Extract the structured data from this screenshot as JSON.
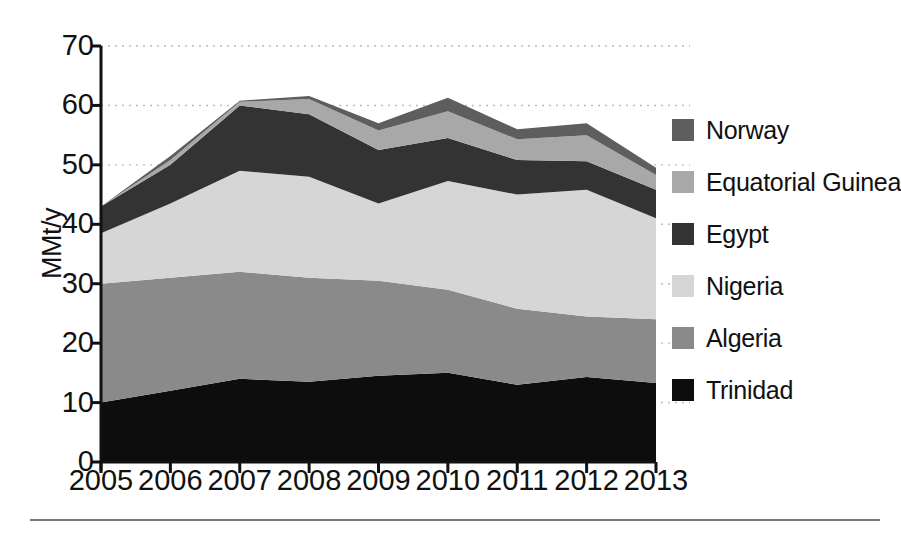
{
  "chart_data": {
    "type": "area",
    "stacked": true,
    "title": "",
    "xlabel": "",
    "ylabel": "MMt/y",
    "categories": [
      "2005",
      "2006",
      "2007",
      "2008",
      "2009",
      "2010",
      "2011",
      "2012",
      "2013"
    ],
    "x": [
      2005,
      2006,
      2007,
      2008,
      2009,
      2010,
      2011,
      2012,
      2013
    ],
    "ylim": [
      0,
      70
    ],
    "yticks": [
      0,
      10,
      20,
      30,
      40,
      50,
      60,
      70
    ],
    "ytick_labels": [
      "0",
      "10",
      "20",
      "30",
      "40",
      "50",
      "60",
      "70"
    ],
    "grid": "horizontal-dotted",
    "legend_position": "right",
    "series": [
      {
        "name": "Trinidad",
        "color": "#0d0d0d",
        "values": [
          10.0,
          12.0,
          14.0,
          13.5,
          14.5,
          15.0,
          13.0,
          14.3,
          13.3
        ]
      },
      {
        "name": "Algeria",
        "color": "#8a8a8a",
        "values": [
          20.0,
          19.0,
          18.0,
          17.5,
          16.0,
          14.0,
          12.8,
          10.2,
          10.7
        ]
      },
      {
        "name": "Nigeria",
        "color": "#d6d6d6",
        "values": [
          8.5,
          12.5,
          17.0,
          17.0,
          13.0,
          18.3,
          19.2,
          21.3,
          17.0
        ]
      },
      {
        "name": "Egypt",
        "color": "#333333",
        "values": [
          4.5,
          6.5,
          11.0,
          10.5,
          9.0,
          7.2,
          5.8,
          4.8,
          4.8
        ]
      },
      {
        "name": "Equatorial Guinea",
        "color": "#a8a8a8",
        "values": [
          0.0,
          0.8,
          0.6,
          2.6,
          3.3,
          4.5,
          3.5,
          4.4,
          2.5
        ]
      },
      {
        "name": "Norway",
        "color": "#5e5e5e",
        "values": [
          0.0,
          0.7,
          0.2,
          0.5,
          1.2,
          2.3,
          1.7,
          2.0,
          1.2
        ]
      }
    ],
    "stack_order_bottom_to_top": [
      "Trinidad",
      "Algeria",
      "Nigeria",
      "Egypt",
      "Equatorial Guinea",
      "Norway"
    ],
    "series_totals": [
      43.0,
      52.3,
      60.8,
      61.6,
      57.0,
      61.3,
      56.0,
      57.0,
      49.5
    ]
  },
  "axes": {
    "ylabel": "MMt/y",
    "ytick_labels": [
      "70",
      "60",
      "50",
      "40",
      "30",
      "20",
      "10",
      "0"
    ],
    "xtick_labels": [
      "2005",
      "2006",
      "2007",
      "2008",
      "2009",
      "2010",
      "2011",
      "2012",
      "2013"
    ]
  },
  "legend": {
    "items": [
      {
        "label": "Norway",
        "color": "#5e5e5e"
      },
      {
        "label": "Equatorial Guinea",
        "color": "#a8a8a8"
      },
      {
        "label": "Egypt",
        "color": "#333333"
      },
      {
        "label": "Nigeria",
        "color": "#d6d6d6"
      },
      {
        "label": "Algeria",
        "color": "#8a8a8a"
      },
      {
        "label": "Trinidad",
        "color": "#0d0d0d"
      }
    ]
  }
}
